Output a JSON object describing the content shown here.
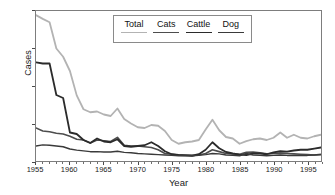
{
  "chart_data": {
    "type": "line",
    "title": "",
    "xlabel": "Year",
    "ylabel": "Cases",
    "xlim": [
      1955,
      1997
    ],
    "ylim": [
      0,
      4000
    ],
    "xticks": [
      1955,
      1960,
      1965,
      1970,
      1975,
      1980,
      1985,
      1990,
      1995
    ],
    "xtick_labels": [
      "1955",
      "1960",
      "1965",
      "1970",
      "1975",
      "1980",
      "1985",
      "1990",
      "1995"
    ],
    "yticks": [
      0,
      1000,
      2000,
      3000,
      4000
    ],
    "ytick_labels": [
      "0",
      "1,000",
      "2,000",
      "3,000",
      "4,000"
    ],
    "minor_xtick_interval": 1,
    "grid": false,
    "legend_position": "top-center",
    "legend_layout": "horizontal",
    "x": [
      1955,
      1956,
      1957,
      1958,
      1959,
      1960,
      1961,
      1962,
      1963,
      1964,
      1965,
      1966,
      1967,
      1968,
      1969,
      1970,
      1971,
      1972,
      1973,
      1974,
      1975,
      1976,
      1977,
      1978,
      1979,
      1980,
      1981,
      1982,
      1983,
      1984,
      1985,
      1986,
      1987,
      1988,
      1989,
      1990,
      1991,
      1992,
      1993,
      1994,
      1995,
      1996,
      1997
    ],
    "series": [
      {
        "name": "Total",
        "color": "#b3b3b3",
        "width": 1.8,
        "values": [
          3890,
          3790,
          3700,
          3000,
          2780,
          2400,
          1750,
          1380,
          1300,
          1320,
          1240,
          1200,
          1400,
          1120,
          1000,
          900,
          880,
          960,
          940,
          800,
          560,
          460,
          500,
          520,
          560,
          840,
          1100,
          820,
          640,
          600,
          460,
          530,
          580,
          600,
          560,
          620,
          760,
          620,
          700,
          620,
          600,
          660,
          700
        ]
      },
      {
        "name": "Cats",
        "color": "#4d4d4d",
        "width": 1.6,
        "values": [
          880,
          800,
          780,
          740,
          720,
          660,
          580,
          560,
          480,
          560,
          540,
          520,
          630,
          420,
          400,
          400,
          380,
          360,
          300,
          200,
          180,
          160,
          160,
          150,
          160,
          200,
          300,
          250,
          200,
          190,
          180,
          230,
          240,
          220,
          190,
          200,
          210,
          200,
          190,
          180,
          170,
          160,
          180
        ]
      },
      {
        "name": "Cattle",
        "color": "#2b2b2b",
        "width": 1.8,
        "values": [
          2630,
          2600,
          2600,
          1760,
          1680,
          760,
          720,
          560,
          480,
          600,
          520,
          500,
          580,
          400,
          380,
          400,
          420,
          500,
          400,
          260,
          180,
          160,
          150,
          140,
          180,
          300,
          500,
          340,
          240,
          200,
          170,
          160,
          200,
          200,
          180,
          230,
          260,
          250,
          280,
          300,
          300,
          330,
          360
        ]
      },
      {
        "name": "Dog",
        "color": "#3a3a3a",
        "width": 1.5,
        "values": [
          400,
          430,
          420,
          400,
          380,
          320,
          290,
          270,
          250,
          250,
          240,
          240,
          260,
          230,
          220,
          200,
          190,
          180,
          170,
          160,
          150,
          140,
          140,
          140,
          150,
          170,
          200,
          190,
          160,
          150,
          140,
          200,
          160,
          150,
          140,
          150,
          160,
          150,
          150,
          150,
          150,
          160,
          170
        ]
      }
    ]
  },
  "axes": {
    "y_label": "Cases",
    "x_label": "Year"
  },
  "legend": {
    "items": [
      {
        "label": "Total"
      },
      {
        "label": "Cats"
      },
      {
        "label": "Cattle"
      },
      {
        "label": "Dog"
      }
    ]
  }
}
